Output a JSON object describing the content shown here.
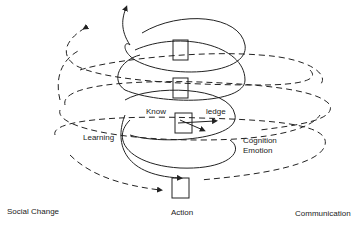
{
  "diagram": {
    "center_labels": {
      "know": "Know",
      "ledge": "ledge",
      "learning": "Learning",
      "cognition": "Cognition",
      "emotion": "Emotion"
    },
    "bottom_labels": {
      "left": "Social Change",
      "center": "Action",
      "right": "Communication"
    },
    "colors": {
      "line": "#222222",
      "background": "#ffffff"
    }
  }
}
